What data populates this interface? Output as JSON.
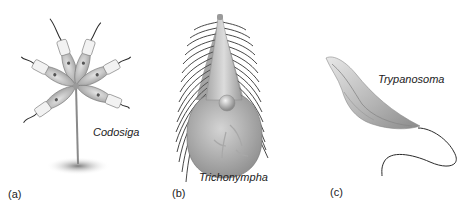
{
  "figure": {
    "panels": [
      {
        "label": "(a)",
        "species": "Codosiga"
      },
      {
        "label": "(b)",
        "species": "Trichonympha"
      },
      {
        "label": "(c)",
        "species": "Trypanosoma"
      }
    ]
  },
  "colors": {
    "cell_fill": "#c9c9c9",
    "cell_shade": "#9a9a9a",
    "outline": "#555555",
    "flagellum": "#2a2a2a",
    "collar": "#f2f2f2",
    "shadow": "#8a8a8a",
    "text": "#222222"
  }
}
